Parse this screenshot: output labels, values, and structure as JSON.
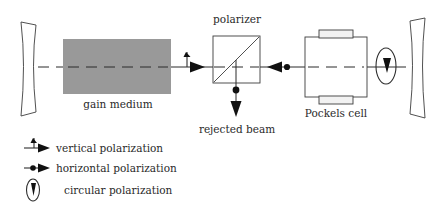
{
  "figure": {
    "type": "optical-cavity-schematic",
    "background_color": "#ffffff",
    "ink_color": "#2a2a2a",
    "gain_medium_color": "#999999",
    "width": 439,
    "height": 209
  },
  "labels": {
    "gain_medium": "gain medium",
    "polarizer": "polarizer",
    "rejected_beam": "rejected beam",
    "pockels_cell": "Pockels cell"
  },
  "legend": {
    "items": [
      {
        "symbol": "vertical-polarization-symbol",
        "label": "vertical polarization"
      },
      {
        "symbol": "horizontal-polarization-symbol",
        "label": "horizontal polarization"
      },
      {
        "symbol": "circular-polarization-symbol",
        "label": "circular polarization"
      }
    ]
  },
  "components": [
    {
      "name": "left-cavity-mirror",
      "kind": "curved-mirror"
    },
    {
      "name": "gain-medium-block",
      "kind": "filled-rectangle"
    },
    {
      "name": "polarizer-cube",
      "kind": "square-with-diagonal"
    },
    {
      "name": "pockels-cell-block",
      "kind": "rectangle-with-electrodes"
    },
    {
      "name": "right-cavity-mirror",
      "kind": "curved-mirror"
    }
  ],
  "beam_markers": [
    {
      "name": "vertical-polarization-marker",
      "position": "gain-to-polarizer",
      "direction": "right"
    },
    {
      "name": "horizontal-polarization-marker",
      "position": "polarizer-to-pockels",
      "direction": "left"
    },
    {
      "name": "rejected-beam-marker",
      "position": "below-polarizer",
      "direction": "down"
    },
    {
      "name": "circular-polarization-marker",
      "position": "pockels-to-right-mirror",
      "direction": "down"
    }
  ]
}
